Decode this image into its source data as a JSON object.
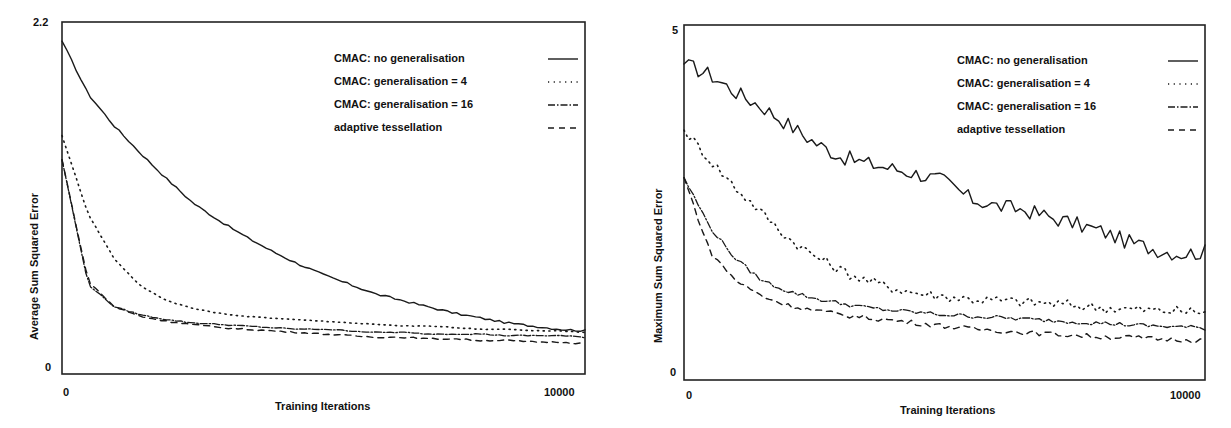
{
  "chart_data": [
    {
      "type": "line",
      "title": "",
      "xlabel": "Training Iterations",
      "ylabel": "Average Sum Squared Error",
      "xlim": [
        0,
        10000
      ],
      "ylim": [
        0,
        2.2
      ],
      "x_ticks": [
        "0",
        "10000"
      ],
      "y_ticks": [
        "0",
        "2.2"
      ],
      "grid": false,
      "legend_position": "upper right (inside)",
      "x": [
        0,
        500,
        1000,
        1500,
        2000,
        2500,
        3000,
        3500,
        4000,
        4500,
        5000,
        5500,
        6000,
        6500,
        7000,
        7500,
        8000,
        8500,
        9000,
        9500,
        10000
      ],
      "series": [
        {
          "name": "CMAC: no generalisation",
          "style": "solid",
          "values": [
            2.08,
            1.75,
            1.55,
            1.38,
            1.22,
            1.07,
            0.96,
            0.86,
            0.77,
            0.69,
            0.62,
            0.56,
            0.5,
            0.46,
            0.42,
            0.38,
            0.35,
            0.32,
            0.3,
            0.28,
            0.27
          ]
        },
        {
          "name": "CMAC: generalisation = 4",
          "style": "dotted",
          "values": [
            1.49,
            1.0,
            0.72,
            0.55,
            0.46,
            0.41,
            0.38,
            0.36,
            0.35,
            0.34,
            0.33,
            0.32,
            0.31,
            0.3,
            0.3,
            0.29,
            0.28,
            0.28,
            0.27,
            0.27,
            0.26
          ]
        },
        {
          "name": "CMAC: generalisation = 16",
          "style": "dashdot",
          "values": [
            1.34,
            0.56,
            0.42,
            0.37,
            0.34,
            0.32,
            0.31,
            0.3,
            0.29,
            0.28,
            0.28,
            0.27,
            0.26,
            0.26,
            0.25,
            0.25,
            0.25,
            0.24,
            0.24,
            0.24,
            0.23
          ]
        },
        {
          "name": "adaptive tessellation",
          "style": "dashed",
          "values": [
            1.34,
            0.58,
            0.42,
            0.36,
            0.33,
            0.31,
            0.29,
            0.28,
            0.27,
            0.26,
            0.25,
            0.24,
            0.23,
            0.23,
            0.22,
            0.22,
            0.21,
            0.21,
            0.2,
            0.2,
            0.19
          ]
        }
      ]
    },
    {
      "type": "line",
      "title": "",
      "xlabel": "Training Iterations",
      "ylabel": "Maximum Sum Squared Error",
      "xlim": [
        0,
        10000
      ],
      "ylim": [
        0,
        5
      ],
      "x_ticks": [
        "0",
        "10000"
      ],
      "y_ticks": [
        "0",
        "5"
      ],
      "grid": false,
      "legend_position": "upper right (inside)",
      "x": [
        0,
        500,
        1000,
        1500,
        2000,
        2500,
        3000,
        3500,
        4000,
        4500,
        5000,
        5500,
        6000,
        6500,
        7000,
        7500,
        8000,
        8500,
        9000,
        9500,
        10000
      ],
      "series": [
        {
          "name": "CMAC: no generalisation",
          "style": "solid",
          "values": [
            4.45,
            4.3,
            4.05,
            3.85,
            3.6,
            3.35,
            3.15,
            3.05,
            2.98,
            2.9,
            2.8,
            2.55,
            2.45,
            2.4,
            2.3,
            2.2,
            2.1,
            1.95,
            1.85,
            1.78,
            1.8
          ]
        },
        {
          "name": "CMAC: generalisation = 4",
          "style": "dotted",
          "values": [
            3.52,
            3.1,
            2.7,
            2.35,
            2.0,
            1.75,
            1.55,
            1.4,
            1.3,
            1.22,
            1.18,
            1.14,
            1.12,
            1.1,
            1.08,
            1.05,
            1.02,
            1.0,
            0.98,
            0.97,
            0.96
          ]
        },
        {
          "name": "CMAC: generalisation = 16",
          "style": "dashdot",
          "values": [
            2.85,
            2.15,
            1.7,
            1.4,
            1.25,
            1.15,
            1.08,
            1.02,
            0.98,
            0.95,
            0.92,
            0.9,
            0.88,
            0.86,
            0.84,
            0.82,
            0.8,
            0.78,
            0.76,
            0.75,
            0.73
          ]
        },
        {
          "name": "adaptive tessellation",
          "style": "dashed",
          "values": [
            2.85,
            1.8,
            1.4,
            1.18,
            1.05,
            0.98,
            0.92,
            0.88,
            0.84,
            0.8,
            0.76,
            0.72,
            0.7,
            0.67,
            0.65,
            0.63,
            0.61,
            0.6,
            0.58,
            0.57,
            0.56
          ]
        }
      ]
    }
  ],
  "charts": {
    "left": {
      "y_top_label": "2.2",
      "y_bottom_label": "0",
      "x_left_label": "0",
      "x_right_label": "10000",
      "xlabel": "Training Iterations",
      "ylabel": "Average Sum Squared Error",
      "legend": [
        {
          "label": "CMAC: no generalisation"
        },
        {
          "label": "CMAC: generalisation = 4"
        },
        {
          "label": "CMAC: generalisation = 16"
        },
        {
          "label": "adaptive tessellation"
        }
      ]
    },
    "right": {
      "y_top_label": "5",
      "y_bottom_label": "0",
      "x_left_label": "0",
      "x_right_label": "10000",
      "xlabel": "Training Iterations",
      "ylabel": "Maximum Sum Squared Error",
      "legend": [
        {
          "label": "CMAC: no generalisation"
        },
        {
          "label": "CMAC: generalisation = 4"
        },
        {
          "label": "CMAC: generalisation = 16"
        },
        {
          "label": "adaptive tessellation"
        }
      ]
    }
  },
  "colors": {
    "ink": "#1a1a1a",
    "frame": "#222222",
    "background": "#ffffff"
  }
}
